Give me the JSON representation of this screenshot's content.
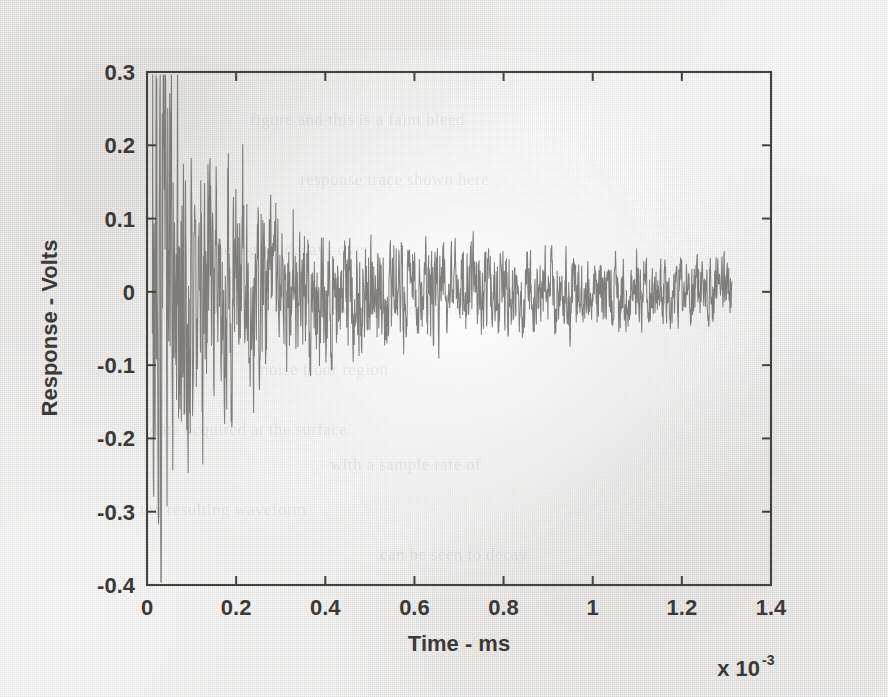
{
  "page": {
    "background_color": "#f2f2f0",
    "ink_color": "#3b3937",
    "trace_color": "#6f6d6b",
    "media": "scanned-paper-figure"
  },
  "ghost_text": [
    {
      "text": "figure and this is a faint bleed",
      "x": 250,
      "y": 110
    },
    {
      "text": "response trace shown here",
      "x": 300,
      "y": 170
    },
    {
      "text": "the signal decays over",
      "x": 210,
      "y": 240
    },
    {
      "text": "measured in the test",
      "x": 330,
      "y": 300
    },
    {
      "text": "noise floor region",
      "x": 260,
      "y": 360
    },
    {
      "text": "data acquired at the surface",
      "x": 150,
      "y": 420
    },
    {
      "text": "with a sample rate of",
      "x": 330,
      "y": 455
    },
    {
      "text": "the resulting waveform",
      "x": 140,
      "y": 500
    },
    {
      "text": "can be seen to decay",
      "x": 380,
      "y": 545
    }
  ],
  "chart_data": {
    "type": "line",
    "title": "",
    "xlabel": "Time - ms",
    "ylabel": "Response - Volts",
    "x_exponent_base": "x 10",
    "x_exponent_power": "-3",
    "xlim": [
      0,
      1.4
    ],
    "ylim": [
      -0.4,
      0.3
    ],
    "xticks": [
      0,
      0.2,
      0.4,
      0.6,
      0.8,
      1,
      1.2,
      1.4
    ],
    "xticklabels": [
      "0",
      "0.2",
      "0.4",
      "0.6",
      "0.8",
      "1",
      "1.2",
      "1.4"
    ],
    "yticks": [
      -0.4,
      -0.3,
      -0.2,
      -0.1,
      0,
      0.1,
      0.2,
      0.3
    ],
    "yticklabels": [
      "-0.4",
      "-0.3",
      "-0.2",
      "-0.1",
      "0",
      "0.1",
      "0.2",
      "0.3"
    ],
    "grid": false,
    "legend": null,
    "tick_direction": "in",
    "box": true,
    "series": [
      {
        "name": "Response",
        "description": "Exponentially decaying high-frequency oscillatory transient with additive noise; begins near t=0.01 with peak amplitude about +0.29 V and minimum about -0.34 V, decaying to a residual noise band of roughly +/-0.05 V by t=1.0, ending at t=1.31.",
        "signal_start_x": 0.012,
        "signal_end_x": 1.312,
        "max_value": 0.295,
        "min_value": -0.345,
        "n_samples": 1700,
        "generator": {
          "sample_count": 1700,
          "envelope_components": [
            {
              "amplitude": 0.255,
              "decay_per_ms": 17.0
            },
            {
              "amplitude": 0.115,
              "decay_per_ms": 4.1
            },
            {
              "amplitude": 0.0425,
              "decay_per_ms": 1.05
            },
            {
              "floor": 0.0215
            }
          ],
          "oscillation_components": [
            {
              "freq": 62.0,
              "weight": 1.0,
              "phase": 0.0
            },
            {
              "freq": 149.0,
              "weight": 0.72,
              "phase": 1.13
            },
            {
              "freq": 231.0,
              "weight": 0.55,
              "phase": 2.41
            },
            {
              "freq": 317.0,
              "weight": 0.4,
              "phase": 0.57
            },
            {
              "freq": 404.0,
              "weight": 0.3,
              "phase": 3.02
            },
            {
              "freq": 97.0,
              "weight": 0.46,
              "phase": 4.41
            },
            {
              "freq": 178.0,
              "weight": 0.36,
              "phase": 5.18
            },
            {
              "freq": 265.0,
              "weight": 0.26,
              "phase": 1.92
            }
          ],
          "noise_weight": 0.62,
          "seed": 20250419
        }
      }
    ]
  },
  "axes_geometry": {
    "left_px": 147,
    "right_px": 771,
    "top_px": 72,
    "bottom_px": 585
  }
}
